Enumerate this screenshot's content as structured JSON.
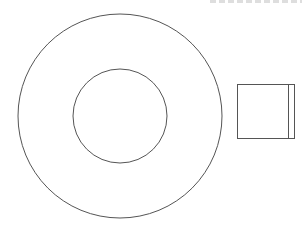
{
  "diagram": {
    "stroke_color": "#555555",
    "outer_circle": {
      "cx": 120,
      "cy": 116,
      "r": 102
    },
    "inner_circle": {
      "cx": 120,
      "cy": 116,
      "r": 47
    },
    "square": {
      "x": 237,
      "y": 84,
      "width": 57,
      "height": 54,
      "inner_line_x": 288
    }
  }
}
